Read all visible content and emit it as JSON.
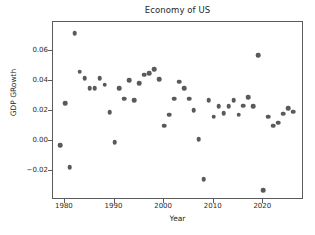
{
  "chart_data": {
    "type": "scatter",
    "title": "Economy of US",
    "xlabel": "Year",
    "ylabel": "GDP GRowth",
    "grid": false,
    "legend": null,
    "xlim": [
      1977.6,
      2028.2
    ],
    "ylim": [
      -0.0395,
      0.0795
    ],
    "xticks": [
      1980,
      1990,
      2000,
      2010,
      2020
    ],
    "xtick_labels": [
      "1980",
      "1990",
      "2000",
      "2010",
      "2020"
    ],
    "yticks": [
      -0.02,
      0.0,
      0.02,
      0.04,
      0.06
    ],
    "ytick_labels": [
      "−0.02",
      "0.00",
      "0.02",
      "0.04",
      "0.06"
    ],
    "marker_color": "#5a5a5a",
    "marker_size": 4.6,
    "series_name": "GDP Growth",
    "x": [
      1979,
      1980,
      1981,
      1982,
      1983,
      1984,
      1985,
      1986,
      1987,
      1988,
      1989,
      1990,
      1991,
      1992,
      1993,
      1994,
      1995,
      1996,
      1997,
      1998,
      1999,
      2000,
      2001,
      2002,
      2003,
      2004,
      2005,
      2006,
      2007,
      2008,
      2009,
      2010,
      2011,
      2012,
      2013,
      2014,
      2015,
      2016,
      2017,
      2018,
      2019,
      2020,
      2021,
      2022,
      2023,
      2024,
      2025,
      2026
    ],
    "y": [
      -0.0029,
      0.0251,
      -0.0177,
      0.0721,
      0.0462,
      0.042,
      0.0354,
      0.0352,
      0.0421,
      0.0375,
      0.0192,
      -0.0009,
      0.0352,
      0.0281,
      0.0404,
      0.0271,
      0.0384,
      0.0443,
      0.0451,
      0.048,
      0.0412,
      0.0103,
      0.0174,
      0.0282,
      0.0396,
      0.0352,
      0.0282,
      0.0205,
      0.0012,
      -0.0256,
      0.0271,
      0.0163,
      0.0232,
      0.0185,
      0.0233,
      0.0272,
      0.0174,
      0.0236,
      0.0292,
      0.0231,
      0.0575,
      -0.033,
      0.0161,
      0.0103,
      0.0123,
      0.0181,
      0.0217,
      0.0196
    ]
  }
}
